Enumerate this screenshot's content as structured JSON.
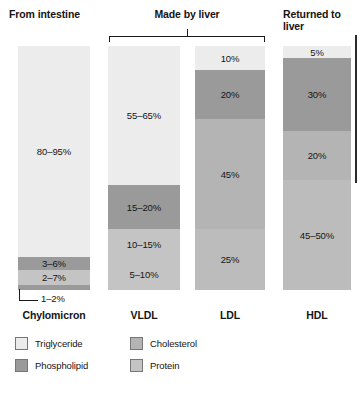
{
  "figure": {
    "groups": [
      {
        "id": "from-intestine",
        "label": "From intestine"
      },
      {
        "id": "made-by-liver",
        "label": "Made by liver"
      },
      {
        "id": "returned-to-liver",
        "label": "Returned to liver"
      }
    ],
    "legend": [
      {
        "key": "triglyceride",
        "label": "Triglyceride",
        "color": "#ececec"
      },
      {
        "key": "phospholipid",
        "label": "Phospholipid",
        "color": "#9a9a9a"
      },
      {
        "key": "cholesterol",
        "label": "Cholesterol",
        "color": "#b4b4b4"
      },
      {
        "key": "protein",
        "label": "Protein",
        "color": "#c4c4c4"
      }
    ],
    "callout": {
      "label": "1–2%"
    }
  },
  "chart_data": {
    "type": "bar",
    "subtype": "stacked-100-percent",
    "xlabel": "",
    "ylabel": "",
    "ylim": [
      0,
      100
    ],
    "grid": false,
    "legend_position": "bottom-left",
    "categories": [
      "Chylomicron",
      "VLDL",
      "LDL",
      "HDL"
    ],
    "components": [
      "Triglyceride",
      "Phospholipid",
      "Cholesterol",
      "Protein"
    ],
    "colors": {
      "Triglyceride": "#ececec",
      "Phospholipid": "#9a9a9a",
      "Cholesterol": "#b4b4b4",
      "Protein": "#c4c4c4"
    },
    "columns": [
      {
        "name": "Chylomicron",
        "group": "From intestine",
        "segments": [
          {
            "component": "Triglyceride",
            "label": "80–95%",
            "low": 80,
            "high": 95,
            "height_pct": 86.5,
            "color": "#ececec",
            "label_inside": true
          },
          {
            "component": "Phospholipid",
            "label": "3–6%",
            "low": 3,
            "high": 6,
            "height_pct": 5.4,
            "color": "#9a9a9a",
            "label_inside": true
          },
          {
            "component": "Cholesterol",
            "label": "2–7%",
            "low": 2,
            "high": 7,
            "height_pct": 6.1,
            "color": "#c4c4c4",
            "label_inside": true
          },
          {
            "component": "Protein",
            "label": "1–2%",
            "low": 1,
            "high": 2,
            "height_pct": 2.0,
            "color": "#9a9a9a",
            "label_inside": false
          }
        ]
      },
      {
        "name": "VLDL",
        "group": "Made by liver",
        "segments": [
          {
            "component": "Triglyceride",
            "label": "55–65%",
            "low": 55,
            "high": 65,
            "height_pct": 57.0,
            "color": "#ececec",
            "label_inside": true
          },
          {
            "component": "Phospholipid",
            "label": "15–20%",
            "low": 15,
            "high": 20,
            "height_pct": 18.0,
            "color": "#9a9a9a",
            "label_inside": true
          },
          {
            "component": "Cholesterol",
            "label": "10–15%",
            "low": 10,
            "high": 15,
            "height_pct": 12.5,
            "color": "#c4c4c4",
            "label_inside": true
          },
          {
            "component": "Protein",
            "label": "5–10%",
            "low": 5,
            "high": 10,
            "height_pct": 12.5,
            "color": "#c4c4c4",
            "label_inside": true
          }
        ]
      },
      {
        "name": "LDL",
        "group": "Made by liver",
        "segments": [
          {
            "component": "Triglyceride",
            "label": "10%",
            "low": 10,
            "high": 10,
            "height_pct": 10.0,
            "color": "#ececec",
            "label_inside": true
          },
          {
            "component": "Phospholipid",
            "label": "20%",
            "low": 20,
            "high": 20,
            "height_pct": 20.0,
            "color": "#9a9a9a",
            "label_inside": true
          },
          {
            "component": "Cholesterol",
            "label": "45%",
            "low": 45,
            "high": 45,
            "height_pct": 45.0,
            "color": "#b4b4b4",
            "label_inside": true
          },
          {
            "component": "Protein",
            "label": "25%",
            "low": 25,
            "high": 25,
            "height_pct": 25.0,
            "color": "#bcbcbc",
            "label_inside": true
          }
        ]
      },
      {
        "name": "HDL",
        "group": "Returned to liver",
        "segments": [
          {
            "component": "Triglyceride",
            "label": "5%",
            "low": 5,
            "high": 5,
            "height_pct": 5.0,
            "color": "#ececec",
            "label_inside": true
          },
          {
            "component": "Phospholipid",
            "label": "30%",
            "low": 30,
            "high": 30,
            "height_pct": 30.0,
            "color": "#9a9a9a",
            "label_inside": true
          },
          {
            "component": "Cholesterol",
            "label": "20%",
            "low": 20,
            "high": 20,
            "height_pct": 20.0,
            "color": "#b4b4b4",
            "label_inside": true
          },
          {
            "component": "Protein",
            "label": "45–50%",
            "low": 45,
            "high": 50,
            "height_pct": 45.0,
            "color": "#bcbcbc",
            "label_inside": true
          }
        ]
      }
    ]
  }
}
